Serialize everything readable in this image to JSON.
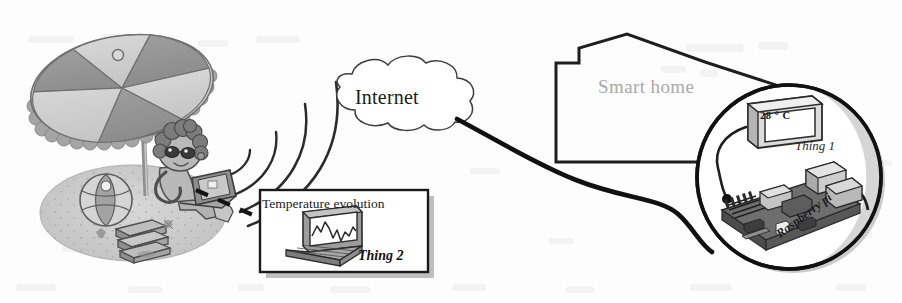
{
  "figure": {
    "kind": "iot-architecture-diagram",
    "background_color": "#fdfdfd",
    "ink_color": "#1a1a1a"
  },
  "nodes": {
    "internet": {
      "label": "Internet",
      "shape": "cloud-icon"
    },
    "smart_home": {
      "label": "Smart home",
      "shape": "house-outline-icon",
      "label_color": "#a9a9a9"
    },
    "thing1": {
      "label": "Thing 1",
      "device_label": "Raspberry pi",
      "display_value": "28 ° C",
      "shape": "magnifier-circle"
    },
    "thing2": {
      "title": "Temperature evolution",
      "label": "Thing 2",
      "device": "laptop-icon",
      "chart": "line-chart-icon"
    },
    "user": {
      "scene": "beach-umbrella-person-laptop",
      "props": [
        "beach-umbrella-icon",
        "beach-ball-icon",
        "books-icon",
        "laptop-icon",
        "person-icon"
      ]
    }
  },
  "links": {
    "wifi_waves": "wifi-arcs-icon",
    "callout_leader": "dashed-leader-line",
    "internet_to_home_cable": "thick-curved-cable"
  }
}
